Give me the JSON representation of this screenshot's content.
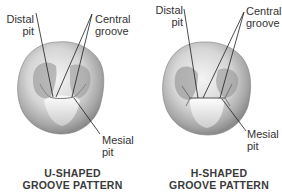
{
  "figure": {
    "panels": [
      {
        "id": "u-shaped",
        "labels": {
          "distal_line1": "Distal",
          "distal_line2": "pit",
          "central_line1": "Central",
          "central_line2": "groove",
          "mesial_line1": "Mesial",
          "mesial_line2": "pit"
        },
        "caption_line1": "U-SHAPED",
        "caption_line2": "GROOVE PATTERN"
      },
      {
        "id": "h-shaped",
        "labels": {
          "distal_line1": "Distal",
          "distal_line2": "pit",
          "central_line1": "Central",
          "central_line2": "groove",
          "mesial_line1": "Mesial",
          "mesial_line2": "pit"
        },
        "caption_line1": "H-SHAPED",
        "caption_line2": "GROOVE PATTERN"
      }
    ]
  }
}
